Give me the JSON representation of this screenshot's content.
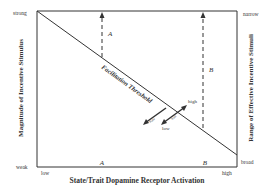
{
  "diagram": {
    "x_axis": {
      "title": "State/Trait Dopamine Receptor Activation",
      "low_label": "low",
      "high_label": "high",
      "marker_a": "A",
      "marker_b": "B"
    },
    "left_axis": {
      "title": "Magnitude of Incentive Stimulus",
      "top_label": "strong",
      "bottom_label": "weak"
    },
    "right_axis": {
      "title": "Range of Effective Incentive Stimuli",
      "top_label": "narrow",
      "bottom_label": "broad"
    },
    "threshold_line": {
      "label": "Facilitation Threshold"
    },
    "arrow_a_label": "A",
    "arrow_b_label": "B",
    "shift_arrows": {
      "high_label": "high",
      "low_label": "low",
      "left_arrow_label": "state",
      "right_arrow_label": "trait"
    }
  }
}
